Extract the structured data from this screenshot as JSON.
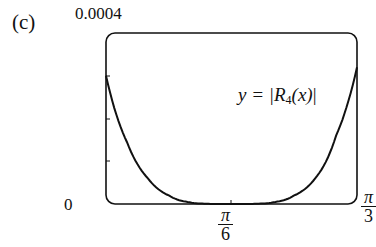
{
  "panel": {
    "label": "(c)"
  },
  "axes": {
    "y_top_label": "0.0004",
    "y_zero_label": "0",
    "x_mid_label": {
      "num": "π",
      "den": "6"
    },
    "x_right_label": {
      "num": "π",
      "den": "3"
    }
  },
  "curve_label": {
    "prefix": "y = |",
    "R": "R",
    "sub": "4",
    "arg": "(x)",
    "suffix": "|"
  },
  "colors": {
    "line": "#111111",
    "background": "#ffffff"
  },
  "chart_data": {
    "type": "line",
    "title": "",
    "panel": "(c)",
    "xlabel": "",
    "ylabel": "",
    "xlim": [
      0,
      1.0472
    ],
    "ylim": [
      0,
      0.0004
    ],
    "x_ticks": [
      "0",
      "π/6",
      "π/3"
    ],
    "y_ticks": [
      "0",
      "0.0001",
      "0.0002",
      "0.0003",
      "0.0004"
    ],
    "y_tick_labels_shown": [
      "0",
      "0.0004"
    ],
    "grid": false,
    "legend": null,
    "annotations": [
      "y = |R4(x)|"
    ],
    "series": [
      {
        "name": "y = |R4(x)|",
        "x": [
          0,
          0.087,
          0.175,
          0.262,
          0.349,
          0.436,
          0.524,
          0.611,
          0.698,
          0.785,
          0.873,
          0.96,
          1.047
        ],
        "y": [
          0.0003,
          0.000145,
          6e-05,
          2e-05,
          4e-06,
          3e-07,
          0,
          3e-07,
          4e-06,
          2e-05,
          6e-05,
          0.00016,
          0.00032
        ]
      }
    ]
  }
}
